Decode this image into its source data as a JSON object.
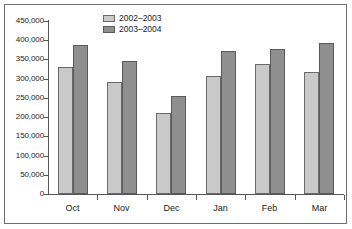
{
  "chart_data": {
    "type": "bar",
    "title": "",
    "subtitle": "",
    "xlabel": "",
    "ylabel": "",
    "categories": [
      "Oct",
      "Nov",
      "Dec",
      "Jan",
      "Feb",
      "Mar"
    ],
    "series": [
      {
        "name": "2002–2003",
        "color": "#c9c9c9",
        "values": [
          331000,
          291000,
          211000,
          307000,
          339000,
          317000
        ]
      },
      {
        "name": "2003–2004",
        "color": "#8f8f8f",
        "values": [
          388000,
          345000,
          255000,
          373000,
          377000,
          394000
        ]
      }
    ],
    "ylim": [
      0,
      450000
    ],
    "ytick_step": 50000,
    "ytick_labels": [
      "450,000",
      "400,000",
      "350,000",
      "300,000",
      "250,000",
      "200,000",
      "150,000",
      "100,000",
      "50,000",
      "0"
    ],
    "ytick_values": [
      450000,
      400000,
      350000,
      300000,
      250000,
      200000,
      150000,
      100000,
      50000,
      0
    ],
    "grid": false,
    "legend_position": "top-center",
    "frame": true
  },
  "legend": {
    "entries": [
      {
        "label": "2002–2003",
        "swatch": "light-gray-swatch"
      },
      {
        "label": "2003–2004",
        "swatch": "dark-gray-swatch"
      }
    ]
  },
  "colors": {
    "series_a": "#c9c9c9",
    "series_b": "#8f8f8f",
    "axis": "#555555",
    "frame": "#6e6e6e",
    "text": "#1a1a1a",
    "background": "#ffffff"
  }
}
